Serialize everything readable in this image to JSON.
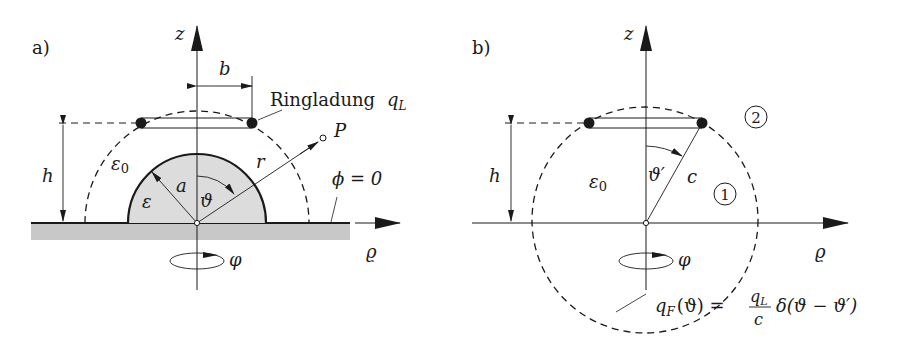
{
  "figure": {
    "panel_a": {
      "label": "a)",
      "axis_z": "z",
      "axis_rho": "ϱ",
      "rotation": "φ",
      "dim_b": "b",
      "dim_h": "h",
      "ring_charge_text": "Ringladung",
      "ring_charge_symbol": "q",
      "ring_charge_sub": "L",
      "eps0": "ε",
      "eps0_sub": "0",
      "eps": "ε",
      "radius_a": "a",
      "angle": "ϑ",
      "radius_r": "r",
      "point": "P",
      "boundary_condition": "ϕ = 0"
    },
    "panel_b": {
      "label": "b)",
      "axis_z": "z",
      "axis_rho": "ϱ",
      "rotation": "φ",
      "dim_h": "h",
      "eps0": "ε",
      "eps0_sub": "0",
      "angle_prime": "ϑ′",
      "radius_c": "c",
      "region_1": "1",
      "region_2": "2",
      "formula_lhs": "q",
      "formula_lhs_sub": "F",
      "formula_lhs_arg": "(ϑ) =",
      "formula_num": "q",
      "formula_num_sub": "L",
      "formula_den": "c",
      "formula_rhs": "δ(ϑ − ϑ′)"
    },
    "colors": {
      "ink": "#1a1a1a",
      "ground_fill": "#c8c8c8",
      "dielectric_fill": "#dcdcdc",
      "background": "#ffffff"
    }
  }
}
